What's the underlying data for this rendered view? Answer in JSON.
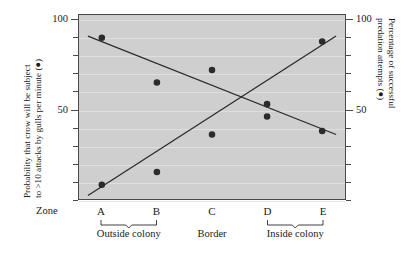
{
  "chart_data": {
    "type": "scatter",
    "title": "",
    "categories": [
      "A",
      "B",
      "C",
      "D",
      "E"
    ],
    "xlabel": "Zone",
    "ylim": [
      0,
      100
    ],
    "y_ticks_major": [
      50,
      100
    ],
    "y_tick_step": 10,
    "grid": true,
    "legend_position": "axis-titles",
    "left_axis": {
      "label_lines": [
        "Probability that crow will be subject",
        "to >10 attacks by gulls per minute (●)"
      ],
      "ticks": [
        "100",
        "50"
      ],
      "min": 0,
      "max": 100
    },
    "right_axis": {
      "label_lines": [
        "Percentage of successful",
        "predation attempts (●)"
      ],
      "ticks": [
        "100",
        "50"
      ],
      "min": 0,
      "max": 100
    },
    "series": [
      {
        "name": "Probability that crow will be subject to >10 attacks by gulls per minute",
        "axis": "left",
        "marker": "filled-circle",
        "values": [
          90,
          65,
          72,
          53,
          38
        ],
        "trendline": {
          "x_start": "A",
          "y_start": 91,
          "x_end": "E",
          "y_end": 36,
          "direction": "descending"
        }
      },
      {
        "name": "Percentage of successful predation attempts",
        "axis": "right",
        "marker": "filled-circle",
        "values": [
          8,
          15,
          36,
          46,
          88
        ],
        "trendline": {
          "x_start": "A",
          "y_start": 2,
          "x_end": "E",
          "y_end": 91,
          "direction": "ascending"
        }
      }
    ],
    "zone_groups": [
      {
        "label": "Outside colony",
        "zones": [
          "A",
          "B"
        ]
      },
      {
        "label": "Border",
        "zones": [
          "C"
        ]
      },
      {
        "label": "Inside colony",
        "zones": [
          "D",
          "E"
        ]
      }
    ],
    "colors": {
      "plot_background": "#cfcfcf",
      "marker": "#2b2b2b",
      "trendline": "#2b2b2b",
      "axis": "#4a4a4a",
      "gridline": "#e2e2e2",
      "page_background": "#ffffff"
    }
  }
}
